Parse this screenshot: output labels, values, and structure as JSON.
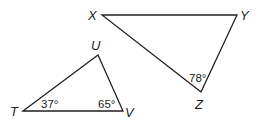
{
  "diagram": {
    "triangles": [
      {
        "name": "XYZ",
        "vertices": {
          "X": {
            "label": "X",
            "x": 102,
            "y": 15
          },
          "Y": {
            "label": "Y",
            "x": 237,
            "y": 15
          },
          "Z": {
            "label": "Z",
            "x": 201,
            "y": 92
          }
        },
        "angles": [
          {
            "vertex": "Z",
            "label": "78°"
          }
        ]
      },
      {
        "name": "TUV",
        "vertices": {
          "T": {
            "label": "T",
            "x": 23,
            "y": 111
          },
          "U": {
            "label": "U",
            "x": 98,
            "y": 55
          },
          "V": {
            "label": "V",
            "x": 123,
            "y": 111
          }
        },
        "angles": [
          {
            "vertex": "T",
            "label": "37°"
          },
          {
            "vertex": "V",
            "label": "65°"
          }
        ]
      }
    ]
  }
}
